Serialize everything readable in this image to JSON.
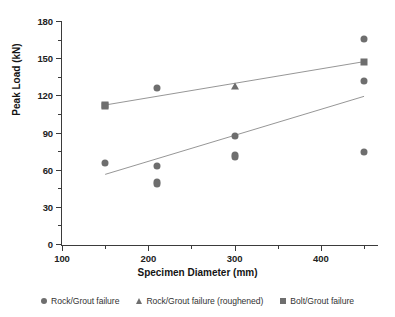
{
  "chart_data": {
    "type": "scatter",
    "title": "",
    "xlabel": "Specimen Diameter (mm)",
    "ylabel": "Peak Load (kN)",
    "xlim": [
      100,
      465
    ],
    "ylim": [
      0,
      180
    ],
    "x_ticks_major": [
      100,
      200,
      300,
      400
    ],
    "x_ticks_minor": [
      150,
      250,
      350,
      450
    ],
    "y_ticks_major": [
      0,
      30,
      60,
      90,
      120,
      150,
      180
    ],
    "y_ticks_minor": [
      15,
      45,
      75,
      105,
      135,
      165
    ],
    "grid": false,
    "legend_position": "bottom",
    "marker_color": "#6e6e6e",
    "axis_color": "#3b3b3b",
    "series": [
      {
        "name": "Rock/Grout failure",
        "marker": "circle",
        "points": [
          {
            "x": 150,
            "y": 66
          },
          {
            "x": 210,
            "y": 127
          },
          {
            "x": 210,
            "y": 64
          },
          {
            "x": 210,
            "y": 51
          },
          {
            "x": 210,
            "y": 49
          },
          {
            "x": 300,
            "y": 88
          },
          {
            "x": 300,
            "y": 73
          },
          {
            "x": 300,
            "y": 71
          },
          {
            "x": 450,
            "y": 166
          },
          {
            "x": 450,
            "y": 132
          },
          {
            "x": 450,
            "y": 75
          }
        ]
      },
      {
        "name": "Rock/Grout failure (roughened)",
        "marker": "triangle",
        "points": [
          {
            "x": 300,
            "y": 128
          }
        ]
      },
      {
        "name": "Bolt/Grout failure",
        "marker": "square",
        "points": [
          {
            "x": 150,
            "y": 113
          },
          {
            "x": 150,
            "y": 112
          },
          {
            "x": 450,
            "y": 148
          }
        ]
      }
    ],
    "trendlines": [
      {
        "name": "bolt-grout-trendline",
        "x1": 150,
        "y1": 113,
        "x2": 450,
        "y2": 148
      },
      {
        "name": "rock-grout-trendline",
        "x1": 150,
        "y1": 57,
        "x2": 450,
        "y2": 120
      }
    ],
    "legend": [
      {
        "label": "Rock/Grout failure",
        "marker": "circle"
      },
      {
        "label": "Rock/Grout failure (roughened)",
        "marker": "triangle"
      },
      {
        "label": "Bolt/Grout failure",
        "marker": "square"
      }
    ]
  }
}
